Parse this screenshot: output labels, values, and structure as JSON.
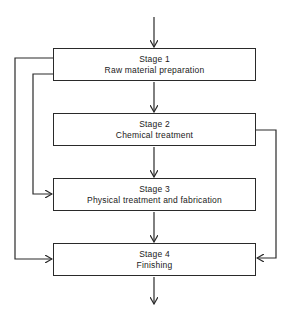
{
  "diagram": {
    "type": "flowchart",
    "stages": [
      {
        "id": "stage1",
        "title": "Stage 1",
        "label": "Raw material preparation"
      },
      {
        "id": "stage2",
        "title": "Stage 2",
        "label": "Chemical treatment"
      },
      {
        "id": "stage3",
        "title": "Stage 3",
        "label": "Physical treatment and fabrication"
      },
      {
        "id": "stage4",
        "title": "Stage 4",
        "label": "Finishing"
      }
    ],
    "edges": [
      {
        "from": "input",
        "to": "stage1"
      },
      {
        "from": "stage1",
        "to": "stage2"
      },
      {
        "from": "stage2",
        "to": "stage3"
      },
      {
        "from": "stage3",
        "to": "stage4"
      },
      {
        "from": "stage4",
        "to": "output"
      },
      {
        "from": "stage1",
        "to": "stage3",
        "route": "left-inner"
      },
      {
        "from": "stage1",
        "to": "stage4",
        "route": "left-outer"
      },
      {
        "from": "stage2",
        "to": "stage4",
        "route": "right"
      }
    ],
    "colors": {
      "line": "#2a2a2a",
      "background": "#ffffff"
    }
  }
}
